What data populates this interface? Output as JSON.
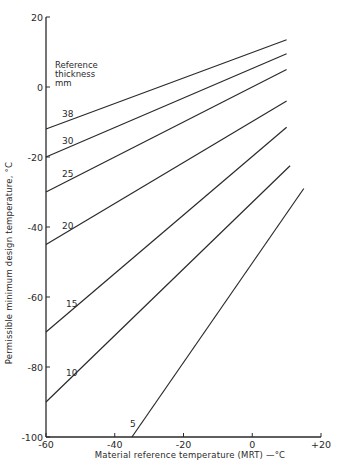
{
  "chart_data": {
    "type": "line",
    "title": "",
    "xlabel": "Material reference temperature (MRT) —°C",
    "ylabel": "Permissible minimum design temperature, °C",
    "xlim": [
      -60,
      20
    ],
    "ylim": [
      -100,
      20
    ],
    "x_ticks": [
      -60,
      -40,
      -20,
      0,
      20
    ],
    "x_tick_labels": [
      "-60",
      "-40",
      "-20",
      "0",
      "+20"
    ],
    "y_ticks": [
      20,
      0,
      -20,
      -40,
      -60,
      -80,
      -100
    ],
    "y_tick_labels": [
      "20",
      "0",
      "-20",
      "-40",
      "-60",
      "-80",
      "-100"
    ],
    "grid": false,
    "legend_title": [
      "Reference",
      "thickness",
      "mm"
    ],
    "series": [
      {
        "name": "38",
        "points": [
          [
            -60,
            -12
          ],
          [
            10,
            13.5
          ]
        ],
        "label_pos": [
          62,
          117
        ]
      },
      {
        "name": "30",
        "points": [
          [
            -60,
            -20
          ],
          [
            10,
            9.5
          ]
        ],
        "label_pos": [
          62,
          144
        ]
      },
      {
        "name": "25",
        "points": [
          [
            -60,
            -30
          ],
          [
            10,
            5
          ]
        ],
        "label_pos": [
          62,
          177
        ]
      },
      {
        "name": "20",
        "points": [
          [
            -60,
            -45
          ],
          [
            10,
            -4
          ]
        ],
        "label_pos": [
          62,
          229
        ]
      },
      {
        "name": "15",
        "points": [
          [
            -60,
            -70
          ],
          [
            10,
            -11.5
          ]
        ],
        "label_pos": [
          66,
          307
        ]
      },
      {
        "name": "10",
        "points": [
          [
            -60,
            -90
          ],
          [
            11,
            -22.5
          ]
        ],
        "label_pos": [
          66,
          376
        ]
      },
      {
        "name": "5",
        "points": [
          [
            -35,
            -100
          ],
          [
            15,
            -29
          ]
        ],
        "label_pos": [
          130,
          427
        ]
      }
    ]
  },
  "colors": {
    "line": "#2a2a2a",
    "background": "#ffffff"
  }
}
